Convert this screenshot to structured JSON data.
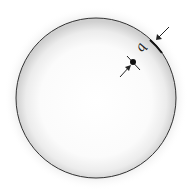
{
  "diagram": {
    "title": "",
    "shape": "sphere",
    "labels": {
      "charge": "q"
    },
    "elements": [
      {
        "kind": "sphere-surface",
        "description": "spherical shell"
      },
      {
        "kind": "point-charge",
        "description": "point at distance q inside the surface"
      },
      {
        "kind": "arrow",
        "description": "arrow pointing inward to surface"
      },
      {
        "kind": "arrow",
        "description": "arrow pointing to the point"
      }
    ],
    "colors": {
      "outline": "#333333",
      "shading_edge": "#bdbdbd",
      "fill_center": "#ffffff",
      "ink": "#111111"
    }
  }
}
